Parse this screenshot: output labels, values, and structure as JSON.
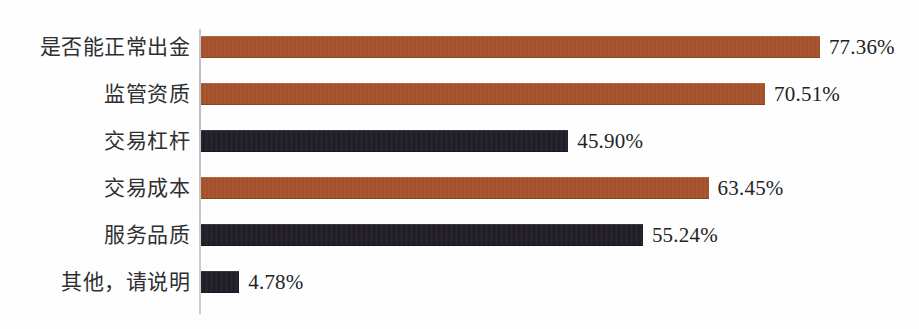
{
  "chart_data": {
    "type": "bar",
    "orientation": "horizontal",
    "title": "",
    "subtitle": "",
    "xlabel": "",
    "ylabel": "",
    "grid": false,
    "legend": "none",
    "axis_line": "category-axis-vertical",
    "xlim": [
      0,
      80
    ],
    "value_suffix": "%",
    "categories": [
      "是否能正常出金",
      "监管资质",
      "交易杠杆",
      "交易成本",
      "服务品质",
      "其他，请说明"
    ],
    "values": [
      77.36,
      70.51,
      45.9,
      63.45,
      55.24,
      4.78
    ],
    "value_labels": [
      "77.36%",
      "70.51%",
      "45.90%",
      "63.45%",
      "55.24%",
      "4.78%"
    ],
    "bar_colors": [
      "#a9522c",
      "#a9522c",
      "#1e1b26",
      "#a9522c",
      "#1e1b26",
      "#1e1b26"
    ],
    "palette": {
      "rust": "#a9522c",
      "dark": "#1e1b26",
      "axis": "#c4c4c4",
      "text": "#2f2f31",
      "background": "#fefefe"
    }
  },
  "bars": [
    {
      "label": "是否能正常出金",
      "value_label": "77.36%",
      "value": 77.36,
      "color_key": "rust"
    },
    {
      "label": "监管资质",
      "value_label": "70.51%",
      "value": 70.51,
      "color_key": "rust"
    },
    {
      "label": "交易杠杆",
      "value_label": "45.90%",
      "value": 45.9,
      "color_key": "dark"
    },
    {
      "label": "交易成本",
      "value_label": "63.45%",
      "value": 63.45,
      "color_key": "rust"
    },
    {
      "label": "服务品质",
      "value_label": "55.24%",
      "value": 55.24,
      "color_key": "dark"
    },
    {
      "label": "其他，请说明",
      "value_label": "4.78%",
      "value": 4.78,
      "color_key": "dark"
    }
  ]
}
